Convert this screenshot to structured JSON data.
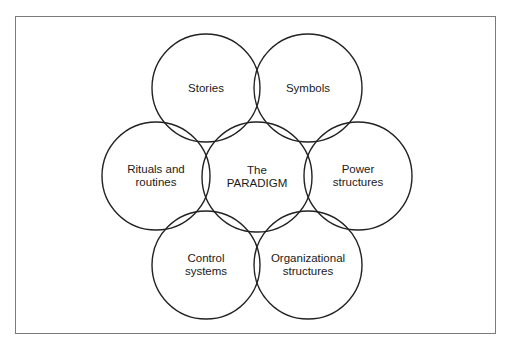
{
  "diagram": {
    "type": "cultural-web",
    "frame_color": "#7a7a7a",
    "stroke_color": "#222222",
    "nodes": [
      {
        "id": "stories",
        "lines": [
          "Stories"
        ],
        "cx": 206,
        "cy": 88,
        "r": 54
      },
      {
        "id": "symbols",
        "lines": [
          "Symbols"
        ],
        "cx": 308,
        "cy": 88,
        "r": 54
      },
      {
        "id": "rituals",
        "lines": [
          "Rituals and",
          "routines"
        ],
        "cx": 156,
        "cy": 176,
        "r": 54
      },
      {
        "id": "paradigm",
        "lines": [
          "The",
          "PARADIGM"
        ],
        "cx": 257,
        "cy": 177,
        "r": 55
      },
      {
        "id": "power",
        "lines": [
          "Power",
          "structures"
        ],
        "cx": 358,
        "cy": 176,
        "r": 54
      },
      {
        "id": "control",
        "lines": [
          "Control",
          "systems"
        ],
        "cx": 206,
        "cy": 265,
        "r": 54
      },
      {
        "id": "organizational",
        "lines": [
          "Organizational",
          "structures"
        ],
        "cx": 308,
        "cy": 265,
        "r": 54
      }
    ]
  }
}
